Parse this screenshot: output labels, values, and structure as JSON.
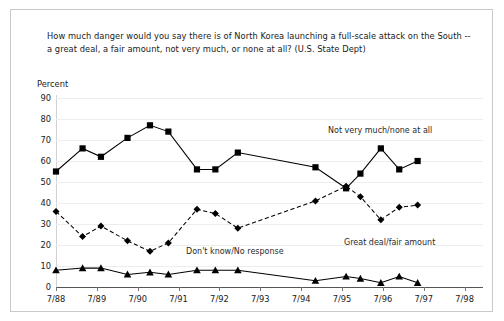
{
  "question": "How much danger would you say there is of North Korea launching a full-scale attack on the South -- a great deal, a fair amount,  not very much,  or none at all? (U.S. State Dept)",
  "y_axis_title": "Percent",
  "annotations": {
    "not_very_much": "Not very much/none at all",
    "great_deal": "Great deal/fair amount",
    "dont_know": "Don't know/No response"
  },
  "chart_data": {
    "type": "line",
    "title": "How much danger would you say there is of North Korea launching a full-scale attack on the South -- a great deal, a fair amount,  not very much,  or none at all? (U.S. State Dept)",
    "xlabel": "",
    "ylabel": "Percent",
    "ylim": [
      0,
      90
    ],
    "ytick_labels": [
      "0",
      "10",
      "20",
      "30",
      "40",
      "50",
      "60",
      "70",
      "80",
      "90"
    ],
    "yticks": [
      0,
      10,
      20,
      30,
      40,
      50,
      60,
      70,
      80,
      90
    ],
    "xtick_labels": [
      "7/88",
      "7/89",
      "7/90",
      "7/91",
      "7/92",
      "7/93",
      "7/94",
      "7/95",
      "7/96",
      "7/97",
      "7/98"
    ],
    "x": [
      0,
      0.65,
      1.1,
      1.75,
      2.3,
      2.75,
      3.45,
      3.9,
      4.45,
      6.35,
      7.1,
      7.45,
      7.95,
      8.4,
      8.85
    ],
    "grid": true,
    "legend_position": "inline-annotations",
    "series": [
      {
        "name": "Not very much/none at all",
        "marker": "square",
        "linestyle": "solid",
        "color": "#000000",
        "values": [
          55,
          66,
          62,
          71,
          77,
          74,
          56,
          56,
          64,
          57,
          47,
          54,
          66,
          56,
          60
        ]
      },
      {
        "name": "Great deal/fair amount",
        "marker": "diamond",
        "linestyle": "dashed",
        "color": "#000000",
        "values": [
          36,
          24,
          29,
          22,
          17,
          21,
          37,
          35,
          28,
          41,
          48,
          43,
          32,
          38,
          39
        ]
      },
      {
        "name": "Don't know/No response",
        "marker": "triangle",
        "linestyle": "solid",
        "color": "#000000",
        "values": [
          8,
          9,
          9,
          6,
          7,
          6,
          8,
          8,
          8,
          3,
          5,
          4,
          2,
          5,
          2
        ]
      }
    ]
  }
}
